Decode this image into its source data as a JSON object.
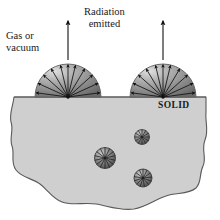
{
  "figure": {
    "title_semantic": "thermal-radiation-emission-from-solid-surface",
    "background_color": "#ffffff",
    "labels": {
      "gas_or_vacuum": "Gas or\nvacuum",
      "radiation_emitted": "Radiation\nemitted",
      "solid": "SOLID"
    },
    "colors": {
      "solid_fill": "#cfcfcf",
      "solid_outline": "#5a5a5a",
      "dome_dark": "#6e6e6e",
      "dome_light": "#d8d8d8",
      "arrow": "#111111",
      "emitter_dark": "#4a4a4a",
      "emitter_light": "#b9b9b9",
      "text": "#1a1a1a"
    },
    "solid_top_y": 97,
    "domes": [
      {
        "name": "left-emission-hemisphere",
        "cx": 68,
        "cy": 97,
        "r": 33,
        "arrow_count": 11
      },
      {
        "name": "right-emission-hemisphere",
        "cx": 163,
        "cy": 97,
        "r": 33,
        "arrow_count": 11
      }
    ],
    "up_arrows": [
      {
        "name": "left-up-arrow",
        "x": 68,
        "y_top": 21,
        "y_bottom": 60
      },
      {
        "name": "right-up-arrow",
        "x": 163,
        "y_top": 21,
        "y_bottom": 60
      }
    ],
    "internal_emitters": [
      {
        "name": "internal-emitter-upper-right",
        "cx": 142,
        "cy": 137,
        "r": 7.5,
        "ray_count": 12
      },
      {
        "name": "internal-emitter-center",
        "cx": 105,
        "cy": 158,
        "r": 10.5,
        "ray_count": 14
      },
      {
        "name": "internal-emitter-lower-right",
        "cx": 143,
        "cy": 178,
        "r": 9,
        "ray_count": 13
      }
    ]
  }
}
